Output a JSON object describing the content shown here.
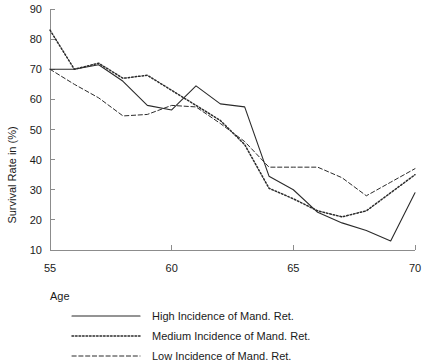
{
  "chart_data": {
    "type": "line",
    "title": "",
    "xlabel": "Age",
    "ylabel": "Survival Rate in (%)",
    "xlim": [
      55,
      70
    ],
    "ylim": [
      10,
      90
    ],
    "xticks": [
      55,
      60,
      65,
      70
    ],
    "yticks": [
      10,
      20,
      30,
      40,
      50,
      60,
      70,
      80,
      90
    ],
    "xtick_labels": [
      "55",
      "60",
      "65",
      "70"
    ],
    "ytick_labels": [
      "10",
      "20",
      "30",
      "40",
      "50",
      "60",
      "70",
      "80",
      "90"
    ],
    "grid": false,
    "legend_position": "below-axes-left",
    "x": [
      55,
      56,
      57,
      58,
      59,
      60,
      61,
      62,
      63,
      64,
      65,
      66,
      67,
      68,
      69,
      70
    ],
    "series": [
      {
        "name": "High Incidence of Mand. Ret.",
        "style": "solid",
        "color": "#2b2b2b",
        "values": [
          70,
          70,
          71.5,
          66,
          58,
          56.5,
          64.5,
          58.5,
          57.5,
          34.5,
          30,
          22.5,
          19,
          16.5,
          13,
          29
        ]
      },
      {
        "name": "Medium Incidence of Mand. Ret.",
        "style": "dotted",
        "color": "#2b2b2b",
        "values": [
          83,
          70,
          72,
          67,
          68,
          63,
          58,
          53,
          45,
          30.5,
          27,
          23,
          21,
          23,
          29,
          35
        ]
      },
      {
        "name": "Low Incidence of Mand. Ret.",
        "style": "dashed",
        "color": "#2b2b2b",
        "values": [
          70,
          65,
          60.5,
          54.5,
          55,
          58,
          57.5,
          52,
          46,
          37.5,
          37.5,
          37.5,
          34,
          28,
          32.5,
          37
        ]
      }
    ]
  },
  "legend": {
    "entries": [
      {
        "label": "High Incidence of Mand. Ret.",
        "style": "solid"
      },
      {
        "label": "Medium Incidence of Mand. Ret.",
        "style": "dotted"
      },
      {
        "label": "Low Incidence of Mand. Ret.",
        "style": "dashed"
      }
    ]
  }
}
